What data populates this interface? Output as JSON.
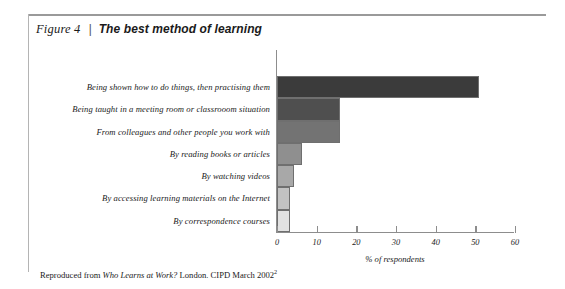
{
  "figure": {
    "number_label": "Figure 4",
    "separator": "|",
    "title": "The best method of learning"
  },
  "source_note": {
    "prefix": "Reproduced from ",
    "work_title": "Who Learns at Work?",
    "suffix": " London. CIPD March 2002",
    "footnote_marker": "2"
  },
  "colors": {
    "bar_1": "#3b3b3b",
    "bar_2": "#4f4f4f",
    "bar_3": "#737373",
    "bar_4": "#8f8f8f",
    "bar_5": "#a8a8a8",
    "bar_6": "#c2c2c2",
    "bar_7": "#e2e2e2",
    "axis": "#8d8d8d",
    "rule": "#9a9a9a",
    "text": "#1a1a1a"
  },
  "chart_data": {
    "type": "bar",
    "orientation": "horizontal",
    "title": "The best method of learning",
    "xlabel": "% of respondents",
    "ylabel": "",
    "xlim": [
      0,
      60
    ],
    "xticks": [
      0,
      10,
      20,
      30,
      40,
      50,
      60
    ],
    "xtick_labels": [
      "0",
      "10",
      "20",
      "30",
      "40",
      "50",
      "60"
    ],
    "grid": false,
    "legend": false,
    "categories": [
      "Being shown how to do things, then practising them",
      "Being taught in a meeting room or classrooom situation",
      "From colleagues and other people you work with",
      "By reading books or articles",
      "By watching videos",
      "By accessing learning materials on the Internet",
      "By correspondence courses"
    ],
    "values": [
      51,
      16,
      16,
      6.4,
      4.3,
      3.3,
      3.3
    ]
  }
}
